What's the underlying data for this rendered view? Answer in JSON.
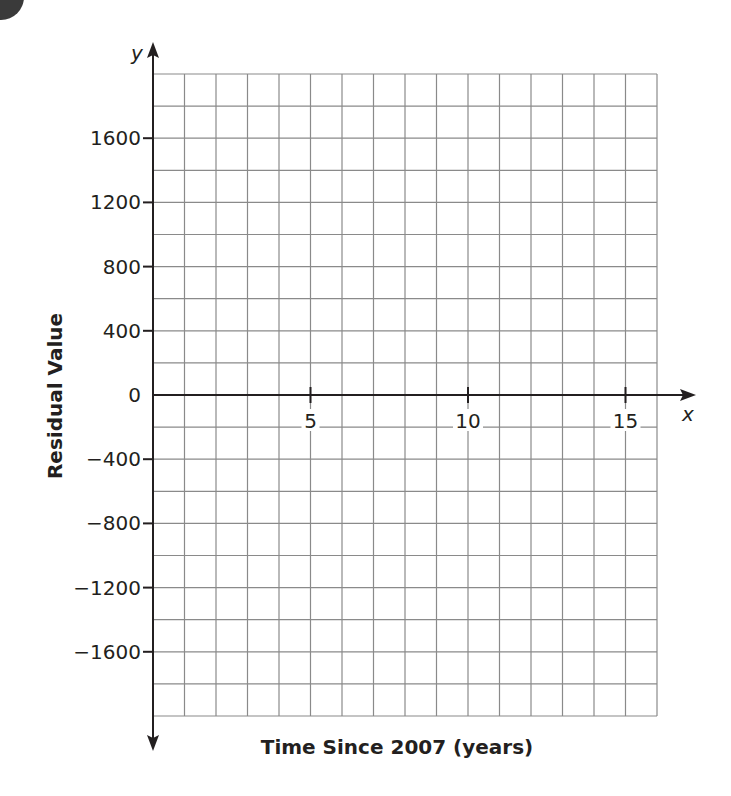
{
  "chart_data": {
    "type": "scatter",
    "title": "",
    "xlabel": "Time Since 2007 (years)",
    "ylabel": "Residual Value",
    "x_axis_symbol": "x",
    "y_axis_symbol": "y",
    "xlim": [
      0,
      16
    ],
    "ylim": [
      -2000,
      2000
    ],
    "x_grid_step": 1,
    "y_grid_step": 200,
    "x_ticks": [
      5,
      10,
      15
    ],
    "x_tick_labels": [
      "5",
      "10",
      "15"
    ],
    "y_ticks": [
      1600,
      1200,
      800,
      400,
      0,
      -400,
      -800,
      -1200,
      -1600
    ],
    "y_tick_labels": [
      "1600",
      "1200",
      "800",
      "400",
      "0",
      "−400",
      "−800",
      "−1200",
      "−1600"
    ],
    "grid": true,
    "series": [],
    "legend": null
  },
  "colors": {
    "axis": "#231f20",
    "grid": "#8a8a8a",
    "text": "#231f20",
    "badge": "#3a3a3a"
  }
}
